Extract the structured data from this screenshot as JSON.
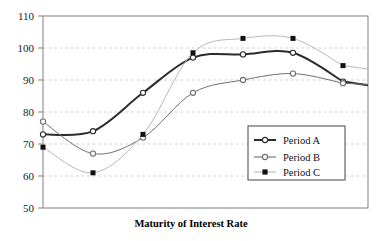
{
  "chart_data": {
    "type": "line",
    "title": "",
    "xlabel": "Maturity of Interest Rate",
    "ylabel": "",
    "ylim": [
      50,
      110
    ],
    "yticks": [
      50,
      60,
      70,
      80,
      90,
      100,
      110
    ],
    "ytick_labels": [
      "50",
      "60",
      "70",
      "80",
      "90",
      "100",
      "110"
    ],
    "x": [
      1,
      2,
      3,
      4,
      5,
      6,
      7
    ],
    "xtick_labels": [],
    "grid": "horizontal-dashed",
    "legend_position": "center-right",
    "series": [
      {
        "name": "Period A",
        "values": [
          73,
          74,
          86,
          97,
          98,
          98.5,
          89.5
        ],
        "color": "#2b2b2b",
        "marker": "open-circle",
        "line_width": 2.0
      },
      {
        "name": "Period B",
        "values": [
          77,
          67,
          72,
          86,
          90,
          92,
          89
        ],
        "color": "#6e6e6e",
        "marker": "open-circle",
        "line_width": 1.0
      },
      {
        "name": "Period C",
        "values": [
          69,
          61,
          73,
          98.5,
          103,
          103,
          94.5
        ],
        "color": "#b8b8b8",
        "marker": "filled-square",
        "line_width": 1.0
      }
    ]
  },
  "legend": {
    "entries": [
      {
        "label": "Period A"
      },
      {
        "label": "Period B"
      },
      {
        "label": "Period C"
      }
    ]
  },
  "axis": {
    "x_title": "Maturity of Interest Rate"
  },
  "colors": {
    "frame": "#8a8a8a",
    "grid": "#c9c9c9",
    "text": "#111111",
    "series_a": "#2b2b2b",
    "series_b": "#6e6e6e",
    "series_c": "#b8b8b8"
  }
}
